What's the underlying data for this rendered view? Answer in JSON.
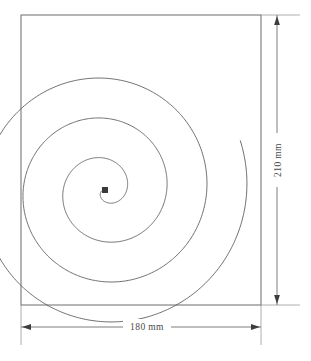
{
  "drawing": {
    "title": "Archimedean spiral inscribed in sheet",
    "background_color": "#ffffff",
    "line_color": "#555555",
    "outline_color": "#6b6b6b",
    "dimension_color": "#4a4a4a",
    "center_marker_color": "#3a3a3a"
  },
  "sheet": {
    "name": "sheet-outline",
    "width_mm": 180,
    "height_mm": 210,
    "x": 21,
    "y": 15,
    "w": 240,
    "h": 290
  },
  "dimensions": {
    "width": {
      "label": "180 mm",
      "value": 180,
      "unit": "mm",
      "orientation": "horizontal",
      "position": "bottom"
    },
    "height": {
      "label": "210 mm",
      "value": 210,
      "unit": "mm",
      "orientation": "vertical",
      "position": "right"
    }
  },
  "spiral": {
    "type": "archimedean",
    "center_x": 105,
    "center_y": 190,
    "turns": 3.6,
    "max_radius": 144,
    "start_angle_deg": 196,
    "direction": "counterclockwise",
    "center_marker": {
      "shape": "square",
      "size": 6
    }
  },
  "icons": {
    "arrow_left": "arrow-left-icon",
    "arrow_right": "arrow-right-icon",
    "arrow_up": "arrow-up-icon",
    "arrow_down": "arrow-down-icon"
  },
  "chart_data": {
    "type": "line",
    "xlabel": "180 mm",
    "ylabel": "210 mm",
    "annotations": [
      "180 mm",
      "210 mm"
    ],
    "series": [
      {
        "name": "spiral",
        "equation": "r = a * theta",
        "turns": 3.6,
        "max_radius_px": 144
      }
    ]
  }
}
